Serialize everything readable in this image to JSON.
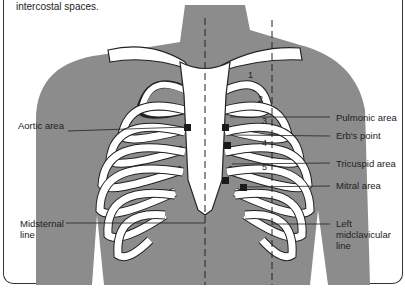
{
  "caption": "intercostal spaces.",
  "labels": {
    "aortic": "Aortic area",
    "pulmonic": "Pulmonic area",
    "erbs": "Erb's point",
    "tricuspid": "Tricuspid area",
    "mitral": "Mitral area",
    "midsternal_1": "Midsternal",
    "midsternal_2": "line",
    "lmcl_1": "Left",
    "lmcl_2": "midclavicular",
    "lmcl_3": "line"
  },
  "rib_numbers": [
    "1",
    "2",
    "3",
    "4",
    "5"
  ],
  "colors": {
    "torso": "#8c8c8c",
    "bone": "#ffffff",
    "outline": "#222222",
    "marker": "#1a1a1a"
  }
}
